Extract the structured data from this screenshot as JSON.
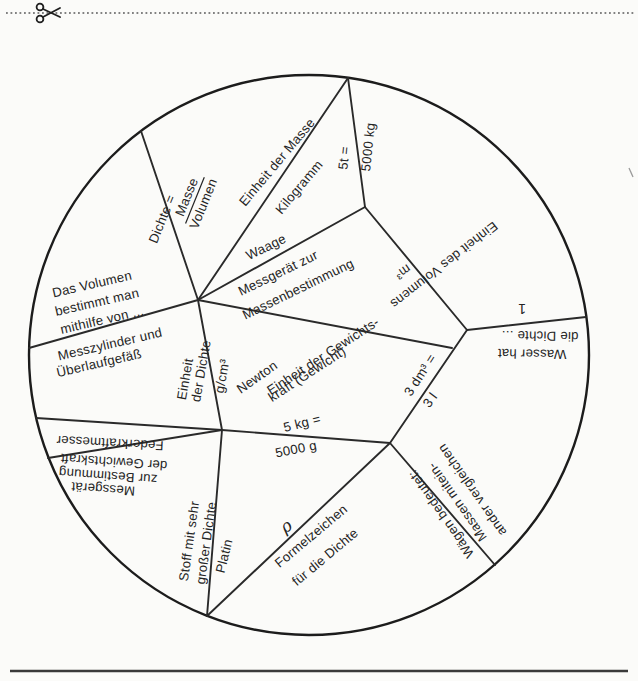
{
  "page": {
    "type": "scanned worksheet",
    "colors": {
      "paper": "#fbfbf9",
      "ink": "#242424",
      "line": "#2a2a2a"
    },
    "icons": {
      "scissors": "✂"
    }
  },
  "wheel": {
    "labels": {
      "dichte_eq": "Dichte =",
      "masse": "Masse",
      "volumen": "Volumen",
      "einheit_der_masse": "Einheit der Masse",
      "kilogramm": "Kilogramm",
      "t5": "5t =",
      "kg5000": "5000 kg",
      "waage": "Waage",
      "messgeraet_zur": "Messgerät zur",
      "massenbestimmung": "Massenbestimmung",
      "einheit_gewichtskraft_1": "Einheit der Gewichts-",
      "einheit_gewichtskraft_2": "kraft (Gewicht)",
      "newton": "Newton",
      "m3": "m³",
      "einheit_des_volumens": "Einheit des Volumens",
      "eins": "1",
      "wasser_hat": "Wasser hat",
      "die_dichte": "die Dichte ...",
      "dm3": "3 dm³ =",
      "l3": "3 l",
      "waegen_bedeutet": "Wägen bedeutet:",
      "massen_mitein": "Massen mitein-",
      "ander_vergleichen": "ander vergleichen",
      "kg5": "5 kg =",
      "g5000": "5000 g",
      "rho": "ρ",
      "formelzeichen": "Formelzeichen",
      "fuer_die_dichte": "für die Dichte",
      "platin": "Platin",
      "stoff_1": "Stoff mit sehr",
      "stoff_2": "großer Dichte",
      "messgeraet_b_1": "Messgerät",
      "messgeraet_b_2": "zur Bestimmung",
      "messgeraet_b_3": "der Gewichtskraft",
      "federkraftmesser": "Federkraftmesser",
      "messzylinder_1": "Messzylinder und",
      "messzylinder_2": "Überlaufgefäß",
      "dasvolumen_1": "Das Volumen",
      "dasvolumen_2": "bestimmt man",
      "dasvolumen_3": "mithilfe von ...",
      "einheit_dichte_1": "Einheit",
      "einheit_dichte_2": "der Dichte",
      "gcm3": "g/cm³"
    }
  }
}
